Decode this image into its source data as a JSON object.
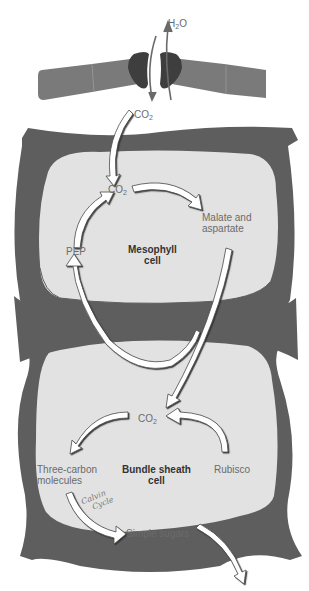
{
  "diagram": {
    "colors": {
      "cell_wall": "#5e5e5e",
      "cytoplasm": "#e2e2e2",
      "guard_cell": "#3e3e3e",
      "epidermis": "#7a7a7a",
      "arrow_fill": "#ffffff",
      "arrow_stroke": "#4a4a4a",
      "label_text": "#6b6b6b",
      "bold_text": "#333333"
    },
    "stoma": {
      "water_label": "H",
      "water_sub": "2",
      "water_suffix": "O",
      "co2_label": "CO",
      "co2_sub": "2"
    },
    "mesophyll": {
      "cell_label_line1": "Mesophyll",
      "cell_label_line2": "cell",
      "co2_label": "CO",
      "co2_sub": "2",
      "product_line1": "Malate and",
      "product_line2": "aspartate",
      "pep_label": "PEP"
    },
    "bundle_sheath": {
      "cell_label_line1": "Bundle sheath",
      "cell_label_line2": "cell",
      "co2_label": "CO",
      "co2_sub": "2",
      "three_carbon_line1": "Three-carbon",
      "three_carbon_line2": "molecules",
      "rubisco_label": "Rubisco",
      "sugars_label": "Simple sugars",
      "handwritten_line1": "Calvin",
      "handwritten_line2": "Cycle"
    }
  }
}
